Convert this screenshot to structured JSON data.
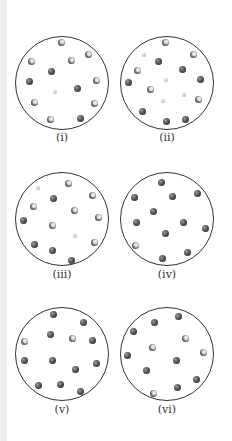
{
  "diagram": {
    "legend_note": "dark = single dark sphere; bicolor = dark sphere with light atom; small = small light sphere",
    "panels": [
      {
        "label": "(i)",
        "cx": 62,
        "cy": 83,
        "r": 47,
        "label_y": 138,
        "molecules": [
          {
            "x": 61,
            "y": 42,
            "type": "bicolor"
          },
          {
            "x": 88,
            "y": 54,
            "type": "bicolor"
          },
          {
            "x": 71,
            "y": 60,
            "type": "bicolor"
          },
          {
            "x": 31,
            "y": 61,
            "type": "bicolor"
          },
          {
            "x": 51,
            "y": 71,
            "type": "dark"
          },
          {
            "x": 29,
            "y": 81,
            "type": "dark"
          },
          {
            "x": 96,
            "y": 80,
            "type": "bicolor"
          },
          {
            "x": 77,
            "y": 88,
            "type": "dark"
          },
          {
            "x": 55,
            "y": 92,
            "type": "small"
          },
          {
            "x": 34,
            "y": 102,
            "type": "bicolor"
          },
          {
            "x": 94,
            "y": 103,
            "type": "bicolor"
          },
          {
            "x": 50,
            "y": 119,
            "type": "bicolor"
          },
          {
            "x": 80,
            "y": 118,
            "type": "dark"
          }
        ]
      },
      {
        "label": "(ii)",
        "cx": 167,
        "cy": 83,
        "r": 47,
        "label_y": 138,
        "molecules": [
          {
            "x": 165,
            "y": 42,
            "type": "bicolor"
          },
          {
            "x": 144,
            "y": 55,
            "type": "small"
          },
          {
            "x": 193,
            "y": 54,
            "type": "bicolor"
          },
          {
            "x": 158,
            "y": 61,
            "type": "dark"
          },
          {
            "x": 137,
            "y": 70,
            "type": "bicolor"
          },
          {
            "x": 182,
            "y": 69,
            "type": "dark"
          },
          {
            "x": 128,
            "y": 82,
            "type": "dark"
          },
          {
            "x": 200,
            "y": 79,
            "type": "dark"
          },
          {
            "x": 166,
            "y": 80,
            "type": "small"
          },
          {
            "x": 150,
            "y": 89,
            "type": "bicolor"
          },
          {
            "x": 184,
            "y": 95,
            "type": "small"
          },
          {
            "x": 163,
            "y": 101,
            "type": "small"
          },
          {
            "x": 198,
            "y": 99,
            "type": "bicolor"
          },
          {
            "x": 142,
            "y": 111,
            "type": "dark"
          },
          {
            "x": 166,
            "y": 121,
            "type": "dark"
          },
          {
            "x": 185,
            "y": 119,
            "type": "dark"
          }
        ]
      },
      {
        "label": "(iii)",
        "cx": 62,
        "cy": 219,
        "r": 47,
        "label_y": 275,
        "molecules": [
          {
            "x": 38,
            "y": 188,
            "type": "small"
          },
          {
            "x": 68,
            "y": 183,
            "type": "bicolor"
          },
          {
            "x": 92,
            "y": 195,
            "type": "bicolor"
          },
          {
            "x": 53,
            "y": 198,
            "type": "dark"
          },
          {
            "x": 33,
            "y": 206,
            "type": "bicolor"
          },
          {
            "x": 74,
            "y": 210,
            "type": "bicolor"
          },
          {
            "x": 98,
            "y": 217,
            "type": "bicolor"
          },
          {
            "x": 23,
            "y": 220,
            "type": "dark"
          },
          {
            "x": 52,
            "y": 225,
            "type": "bicolor"
          },
          {
            "x": 75,
            "y": 236,
            "type": "small"
          },
          {
            "x": 94,
            "y": 242,
            "type": "bicolor"
          },
          {
            "x": 34,
            "y": 244,
            "type": "dark"
          },
          {
            "x": 52,
            "y": 250,
            "type": "dark"
          },
          {
            "x": 71,
            "y": 260,
            "type": "dark"
          }
        ]
      },
      {
        "label": "(iv)",
        "cx": 167,
        "cy": 219,
        "r": 47,
        "label_y": 275,
        "molecules": [
          {
            "x": 161,
            "y": 182,
            "type": "dark"
          },
          {
            "x": 134,
            "y": 197,
            "type": "dark"
          },
          {
            "x": 172,
            "y": 196,
            "type": "dark"
          },
          {
            "x": 197,
            "y": 193,
            "type": "dark"
          },
          {
            "x": 153,
            "y": 211,
            "type": "dark"
          },
          {
            "x": 136,
            "y": 222,
            "type": "dark"
          },
          {
            "x": 183,
            "y": 222,
            "type": "dark"
          },
          {
            "x": 205,
            "y": 228,
            "type": "dark"
          },
          {
            "x": 165,
            "y": 233,
            "type": "dark"
          },
          {
            "x": 135,
            "y": 245,
            "type": "bicolor"
          },
          {
            "x": 187,
            "y": 252,
            "type": "dark"
          },
          {
            "x": 162,
            "y": 258,
            "type": "dark"
          }
        ]
      },
      {
        "label": "(v)",
        "cx": 62,
        "cy": 354,
        "r": 47,
        "label_y": 410,
        "molecules": [
          {
            "x": 53,
            "y": 314,
            "type": "dark"
          },
          {
            "x": 83,
            "y": 322,
            "type": "dark"
          },
          {
            "x": 50,
            "y": 334,
            "type": "dark"
          },
          {
            "x": 72,
            "y": 338,
            "type": "bicolor"
          },
          {
            "x": 24,
            "y": 341,
            "type": "bicolor"
          },
          {
            "x": 92,
            "y": 340,
            "type": "dark"
          },
          {
            "x": 24,
            "y": 360,
            "type": "dark"
          },
          {
            "x": 52,
            "y": 360,
            "type": "dark"
          },
          {
            "x": 96,
            "y": 363,
            "type": "dark"
          },
          {
            "x": 75,
            "y": 369,
            "type": "dark"
          },
          {
            "x": 38,
            "y": 385,
            "type": "dark"
          },
          {
            "x": 60,
            "y": 384,
            "type": "dark"
          },
          {
            "x": 80,
            "y": 391,
            "type": "dark"
          }
        ]
      },
      {
        "label": "(vi)",
        "cx": 167,
        "cy": 354,
        "r": 47,
        "label_y": 410,
        "molecules": [
          {
            "x": 178,
            "y": 316,
            "type": "dark"
          },
          {
            "x": 154,
            "y": 322,
            "type": "dark"
          },
          {
            "x": 133,
            "y": 331,
            "type": "dark"
          },
          {
            "x": 185,
            "y": 338,
            "type": "bicolor"
          },
          {
            "x": 152,
            "y": 347,
            "type": "bicolor"
          },
          {
            "x": 203,
            "y": 352,
            "type": "bicolor"
          },
          {
            "x": 127,
            "y": 355,
            "type": "dark"
          },
          {
            "x": 176,
            "y": 360,
            "type": "dark"
          },
          {
            "x": 146,
            "y": 370,
            "type": "dark"
          },
          {
            "x": 196,
            "y": 379,
            "type": "dark"
          },
          {
            "x": 177,
            "y": 387,
            "type": "dark"
          },
          {
            "x": 153,
            "y": 393,
            "type": "bicolor"
          }
        ]
      }
    ]
  }
}
